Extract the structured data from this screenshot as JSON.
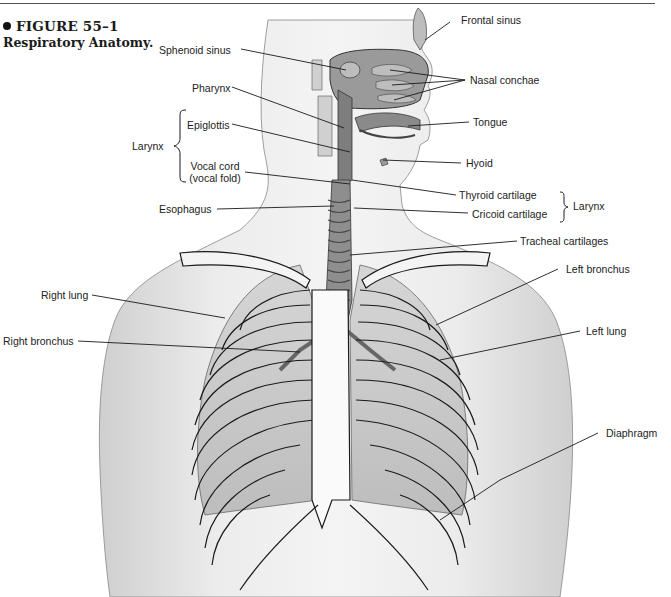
{
  "figure": {
    "number": "FIGURE 55–1",
    "title": "Respiratory Anatomy.",
    "bullet_icon": "filled-circle"
  },
  "labels": {
    "frontal_sinus": "Frontal sinus",
    "sphenoid_sinus": "Sphenoid sinus",
    "nasal_conchae": "Nasal conchae",
    "pharynx": "Pharynx",
    "tongue": "Tongue",
    "larynx_left": "Larynx",
    "epiglottis": "Epiglottis",
    "vocal_cord_1": "Vocal cord",
    "vocal_cord_2": "(vocal fold)",
    "hyoid": "Hyoid",
    "thyroid_cartilage": "Thyroid cartilage",
    "cricoid_cartilage": "Cricoid cartilage",
    "larynx_right": "Larynx",
    "esophagus": "Esophagus",
    "tracheal_cartilages": "Tracheal cartilages",
    "right_lung": "Right lung",
    "left_bronchus": "Left bronchus",
    "right_bronchus": "Right bronchus",
    "left_lung": "Left lung",
    "diaphragm": "Diaphragm"
  },
  "colors": {
    "skin": "#e6e6e6",
    "airway": "#8a8a8a",
    "outline": "#1a1a1a",
    "lung": "#c4c4c4"
  }
}
